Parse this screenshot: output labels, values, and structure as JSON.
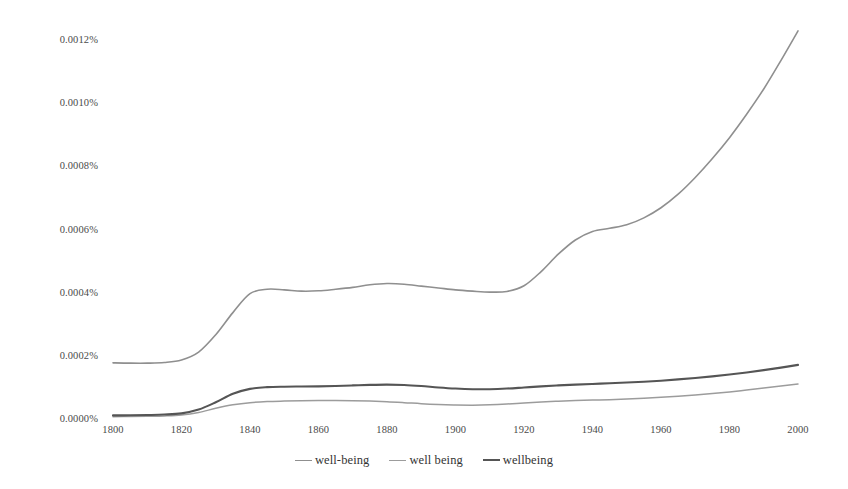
{
  "chart_data": {
    "type": "line",
    "title": "",
    "subtitle": "",
    "xlabel": "",
    "ylabel": "",
    "xlim": [
      1800,
      2000
    ],
    "ylim": [
      0,
      0.0013
    ],
    "grid": false,
    "legend_position": "bottom-center",
    "x_tick_labels": [
      "1800",
      "1820",
      "1840",
      "1860",
      "1880",
      "1900",
      "1920",
      "1940",
      "1960",
      "1980",
      "2000"
    ],
    "x_ticks": [
      1800,
      1820,
      1840,
      1860,
      1880,
      1900,
      1920,
      1940,
      1960,
      1980,
      2000
    ],
    "y_tick_labels": [
      "0.0000%",
      "0.0002%",
      "0.0004%",
      "0.0006%",
      "0.0008%",
      "0.0010%",
      "0.0012%"
    ],
    "y_ticks": [
      0.0,
      0.0002,
      0.0004,
      0.0006,
      0.0008,
      0.001,
      0.0012
    ],
    "y_unit": "%",
    "x": [
      1800,
      1805,
      1810,
      1815,
      1820,
      1825,
      1830,
      1835,
      1840,
      1845,
      1850,
      1855,
      1860,
      1865,
      1870,
      1875,
      1880,
      1885,
      1890,
      1895,
      1900,
      1905,
      1910,
      1915,
      1920,
      1925,
      1930,
      1935,
      1940,
      1945,
      1950,
      1955,
      1960,
      1965,
      1970,
      1975,
      1980,
      1985,
      1990,
      1995,
      2000
    ],
    "series": [
      {
        "name": "well-being",
        "color": "#8f8f8f",
        "width": 1.6,
        "values": [
          0.000181,
          0.00018,
          0.00018,
          0.000182,
          0.00019,
          0.000215,
          0.00027,
          0.00034,
          0.0004,
          0.000414,
          0.000412,
          0.000408,
          0.000409,
          0.000414,
          0.00042,
          0.000428,
          0.000432,
          0.00043,
          0.000424,
          0.000418,
          0.000412,
          0.000408,
          0.000405,
          0.000407,
          0.000425,
          0.00047,
          0.000525,
          0.00057,
          0.000597,
          0.000607,
          0.000618,
          0.00064,
          0.000672,
          0.000715,
          0.000768,
          0.000828,
          0.000894,
          0.000968,
          0.001048,
          0.001138,
          0.001232
        ]
      },
      {
        "name": "well being",
        "color": "#9c9c9c",
        "width": 1.5,
        "values": [
          1.05e-05,
          1.1e-05,
          1.18e-05,
          1.3e-05,
          1.6e-05,
          2.4e-05,
          3.7e-05,
          4.8e-05,
          5.5e-05,
          5.85e-05,
          6e-05,
          6.1e-05,
          6.15e-05,
          6.15e-05,
          6.1e-05,
          6e-05,
          5.8e-05,
          5.5e-05,
          5.15e-05,
          4.9e-05,
          4.75e-05,
          4.7e-05,
          4.8e-05,
          5.05e-05,
          5.4e-05,
          5.7e-05,
          5.95e-05,
          6.15e-05,
          6.3e-05,
          6.45e-05,
          6.65e-05,
          6.9e-05,
          7.2e-05,
          7.55e-05,
          7.95e-05,
          8.4e-05,
          8.9e-05,
          9.5e-05,
          0.000101,
          0.0001075,
          0.000114
        ]
      },
      {
        "name": "wellbeing",
        "color": "#555555",
        "width": 2.1,
        "values": [
          1.45e-05,
          1.5e-05,
          1.58e-05,
          1.72e-05,
          2.1e-05,
          3.3e-05,
          5.6e-05,
          8.3e-05,
          9.85e-05,
          0.000104,
          0.0001055,
          0.000106,
          0.0001065,
          0.0001078,
          0.0001095,
          0.0001112,
          0.000112,
          0.0001108,
          0.0001075,
          0.000103,
          9.95e-05,
          9.75e-05,
          9.75e-05,
          9.95e-05,
          0.000103,
          0.0001065,
          0.0001095,
          0.000112,
          0.0001142,
          0.0001162,
          0.0001185,
          0.0001212,
          0.0001245,
          0.0001285,
          0.000133,
          0.0001382,
          0.000144,
          0.0001505,
          0.0001578,
          0.0001658,
          0.0001745
        ]
      }
    ]
  },
  "legend": {
    "items": [
      {
        "label": "well-being"
      },
      {
        "label": "well being"
      },
      {
        "label": "wellbeing"
      }
    ]
  }
}
